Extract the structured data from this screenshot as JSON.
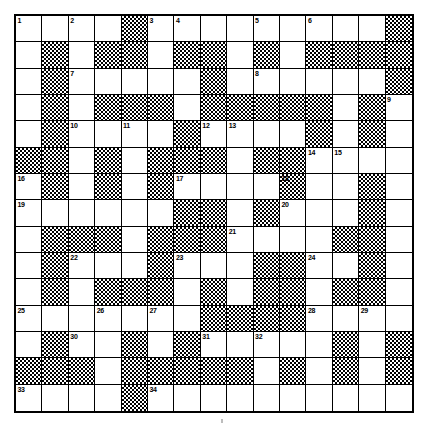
{
  "document": {
    "type": "crossword-puzzle",
    "title": "Crossword Grid",
    "grid_size": "15x15",
    "rows": 15,
    "columns": 15,
    "colors": {
      "blocked_square": "#000000",
      "open_square": "#ffffff",
      "grid_line": "#000000",
      "page_background": "#ffffff"
    }
  },
  "grid": {
    "legend": {
      "0": "open-white-square",
      "1": "blocked-checkered-square"
    },
    "cells": [
      [
        0,
        0,
        0,
        0,
        1,
        0,
        0,
        0,
        0,
        0,
        0,
        0,
        0,
        0,
        1
      ],
      [
        0,
        1,
        0,
        1,
        1,
        0,
        1,
        1,
        0,
        1,
        0,
        1,
        1,
        1,
        1
      ],
      [
        0,
        1,
        0,
        0,
        0,
        0,
        0,
        1,
        0,
        0,
        0,
        0,
        0,
        0,
        1
      ],
      [
        0,
        1,
        0,
        1,
        1,
        1,
        0,
        1,
        1,
        1,
        1,
        1,
        0,
        1,
        0
      ],
      [
        0,
        1,
        0,
        0,
        0,
        0,
        1,
        0,
        0,
        0,
        0,
        1,
        0,
        1,
        0
      ],
      [
        1,
        1,
        0,
        1,
        0,
        1,
        1,
        1,
        0,
        1,
        1,
        0,
        0,
        0,
        0
      ],
      [
        0,
        1,
        0,
        1,
        0,
        1,
        0,
        0,
        0,
        0,
        1,
        0,
        0,
        1,
        0
      ],
      [
        0,
        0,
        0,
        0,
        0,
        0,
        1,
        1,
        0,
        1,
        0,
        0,
        0,
        1,
        0
      ],
      [
        0,
        1,
        1,
        1,
        0,
        1,
        1,
        1,
        0,
        0,
        0,
        0,
        1,
        1,
        0
      ],
      [
        0,
        1,
        0,
        0,
        0,
        1,
        0,
        0,
        0,
        1,
        1,
        0,
        0,
        1,
        0
      ],
      [
        0,
        1,
        0,
        1,
        1,
        1,
        0,
        1,
        0,
        1,
        1,
        0,
        1,
        1,
        0
      ],
      [
        0,
        0,
        0,
        0,
        0,
        0,
        0,
        1,
        1,
        1,
        1,
        0,
        0,
        0,
        0
      ],
      [
        0,
        1,
        0,
        0,
        1,
        0,
        1,
        0,
        0,
        0,
        0,
        0,
        1,
        0,
        1
      ],
      [
        1,
        1,
        1,
        0,
        1,
        1,
        1,
        1,
        1,
        0,
        1,
        0,
        1,
        0,
        1
      ],
      [
        0,
        0,
        0,
        0,
        1,
        0,
        0,
        0,
        0,
        0,
        0,
        0,
        0,
        0,
        0
      ]
    ]
  },
  "numbers": [
    {
      "n": "1",
      "row": 1,
      "col": 1
    },
    {
      "n": "2",
      "row": 1,
      "col": 3
    },
    {
      "n": "3",
      "row": 1,
      "col": 6
    },
    {
      "n": "4",
      "row": 1,
      "col": 7
    },
    {
      "n": "5",
      "row": 1,
      "col": 10
    },
    {
      "n": "6",
      "row": 1,
      "col": 12
    },
    {
      "n": "7",
      "row": 3,
      "col": 3
    },
    {
      "n": "8",
      "row": 3,
      "col": 10
    },
    {
      "n": "9",
      "row": 4,
      "col": 15
    },
    {
      "n": "10",
      "row": 5,
      "col": 3
    },
    {
      "n": "11",
      "row": 5,
      "col": 5
    },
    {
      "n": "12",
      "row": 5,
      "col": 8
    },
    {
      "n": "13",
      "row": 5,
      "col": 9
    },
    {
      "n": "14",
      "row": 6,
      "col": 12
    },
    {
      "n": "15",
      "row": 6,
      "col": 13
    },
    {
      "n": "16",
      "row": 7,
      "col": 1
    },
    {
      "n": "17",
      "row": 7,
      "col": 7
    },
    {
      "n": "18",
      "row": 7,
      "col": 11
    },
    {
      "n": "19",
      "row": 8,
      "col": 1
    },
    {
      "n": "20",
      "row": 8,
      "col": 11
    },
    {
      "n": "21",
      "row": 9,
      "col": 9
    },
    {
      "n": "22",
      "row": 10,
      "col": 3
    },
    {
      "n": "23",
      "row": 10,
      "col": 7
    },
    {
      "n": "24",
      "row": 10,
      "col": 12
    },
    {
      "n": "25",
      "row": 12,
      "col": 1
    },
    {
      "n": "26",
      "row": 12,
      "col": 4
    },
    {
      "n": "27",
      "row": 12,
      "col": 6
    },
    {
      "n": "28",
      "row": 12,
      "col": 12
    },
    {
      "n": "29",
      "row": 12,
      "col": 14
    },
    {
      "n": "30",
      "row": 13,
      "col": 3
    },
    {
      "n": "31",
      "row": 13,
      "col": 8
    },
    {
      "n": "32",
      "row": 13,
      "col": 10
    },
    {
      "n": "33",
      "row": 15,
      "col": 1
    },
    {
      "n": "34",
      "row": 15,
      "col": 6
    }
  ]
}
